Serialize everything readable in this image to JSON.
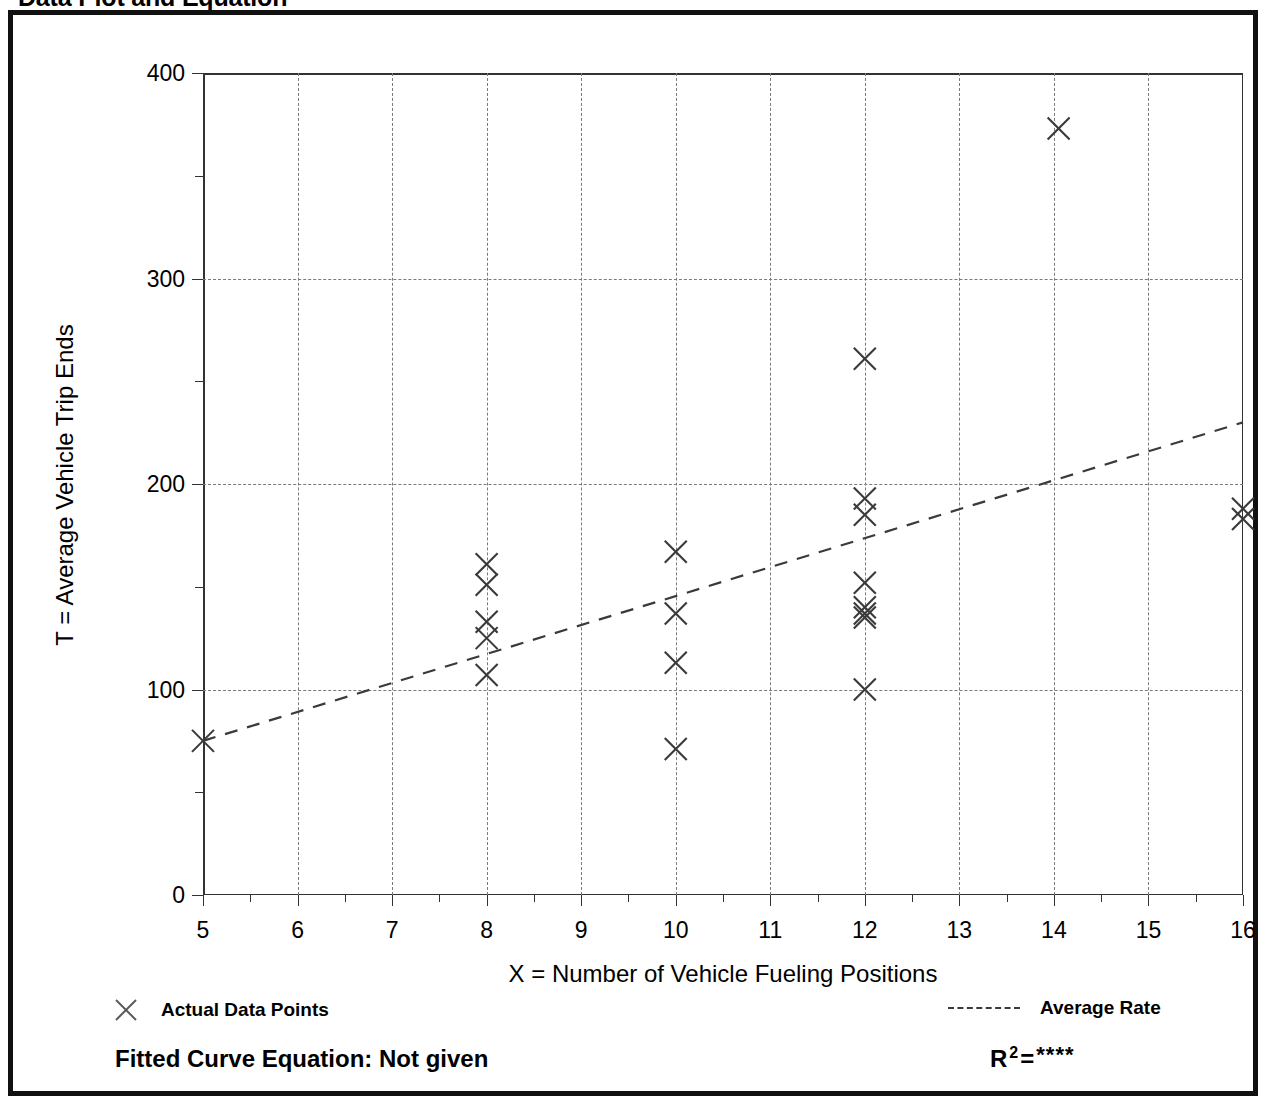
{
  "page_title": "Data Plot and Equation",
  "axes": {
    "y_title": "T = Average Vehicle Trip Ends",
    "x_title": "X = Number of Vehicle Fueling Positions"
  },
  "legend": {
    "actual_marker": "x-marker-icon",
    "actual_label": "Actual Data Points",
    "average_marker": "dashed-line-icon",
    "average_label": "Average Rate"
  },
  "footer": {
    "fitted_equation": "Fitted Curve Equation:  Not given",
    "r_label": "R",
    "r_exponent": "2",
    "r_equals": "=",
    "r_value": "****"
  },
  "colors": {
    "frame": "#111111",
    "axis": "#333333",
    "grid": "#7a7a7a",
    "marker": "#3a3a3a",
    "trend": "#3a3a3a",
    "background": "#ffffff"
  },
  "chart_data": {
    "type": "scatter",
    "title": "Data Plot and Equation",
    "xlabel": "X = Number of Vehicle Fueling Positions",
    "ylabel": "T = Average Vehicle Trip Ends",
    "xlim": [
      5,
      16
    ],
    "ylim": [
      0,
      400
    ],
    "xticks": [
      5,
      6,
      7,
      8,
      9,
      10,
      11,
      12,
      13,
      14,
      15,
      16
    ],
    "xtick_labels": [
      "5",
      "6",
      "7",
      "8",
      "9",
      "10",
      "11",
      "12",
      "13",
      "14",
      "15",
      "16"
    ],
    "x_minor_ticks": [
      5.5,
      6.5,
      7.5,
      8.5,
      9.5,
      10.5,
      11.5,
      12.5,
      13.5,
      14.5,
      15.5
    ],
    "yticks": [
      0,
      100,
      200,
      300,
      400
    ],
    "ytick_labels": [
      "0",
      "100",
      "200",
      "300",
      "400"
    ],
    "y_minor_ticks": [
      50,
      150,
      250,
      350
    ],
    "grid": "dashed both axes",
    "legend_position": "below plot",
    "series": [
      {
        "name": "Actual Data Points",
        "marker": "x",
        "points": [
          [
            5,
            75
          ],
          [
            8,
            161
          ],
          [
            8,
            151
          ],
          [
            8,
            133
          ],
          [
            8,
            125
          ],
          [
            8,
            107
          ],
          [
            10,
            167
          ],
          [
            10,
            137
          ],
          [
            10,
            113
          ],
          [
            10,
            71
          ],
          [
            12,
            261
          ],
          [
            12,
            193
          ],
          [
            12,
            185
          ],
          [
            12,
            152
          ],
          [
            12,
            140
          ],
          [
            12,
            137
          ],
          [
            12,
            135
          ],
          [
            12,
            100
          ],
          [
            14.05,
            373
          ],
          [
            16,
            188
          ],
          [
            16,
            183
          ]
        ]
      },
      {
        "name": "Average Rate",
        "type": "line",
        "style": "dashed",
        "points": [
          [
            5,
            75
          ],
          [
            16,
            230
          ]
        ]
      }
    ],
    "annotations": {
      "fitted_curve_equation": "Not given",
      "r_squared": "****"
    }
  }
}
